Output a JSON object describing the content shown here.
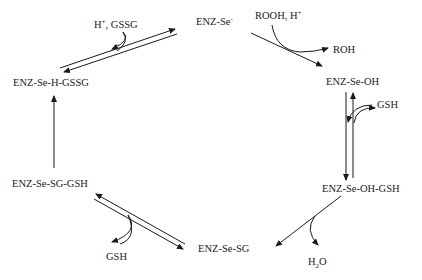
{
  "diagram": {
    "type": "reaction-cycle",
    "nodes": [
      {
        "id": "enz_se_minus",
        "label_main": "ENZ-Se",
        "label_sup": "-"
      },
      {
        "id": "enz_se_oh",
        "label": "ENZ-Se-OH"
      },
      {
        "id": "enz_se_oh_gsh",
        "label": "ENZ-Se-OH-GSH"
      },
      {
        "id": "enz_se_sg",
        "label": "ENZ-Se-SG"
      },
      {
        "id": "enz_se_sg_gsh",
        "label": "ENZ-Se-SG-GSH"
      },
      {
        "id": "enz_se_h_gssg",
        "label": "ENZ-Se-H-GSSG"
      }
    ],
    "reagents": {
      "rooh_main": "ROOH, H",
      "rooh_sup": "+",
      "roh": "ROH",
      "gsh_right": "GSH",
      "h2o_main": "H",
      "h2o_sub": "2",
      "h2o_tail": "O",
      "gsh_bottom": "GSH",
      "h_gssg_main": "H",
      "h_gssg_sup": "+",
      "h_gssg_tail": ", GSSG"
    },
    "edges": [
      {
        "from": "ENZ-Se-",
        "to": "ENZ-Se-OH",
        "reversible": false,
        "in": "ROOH, H+",
        "out": "ROH"
      },
      {
        "from": "ENZ-Se-OH",
        "to": "ENZ-Se-OH-GSH",
        "reversible": true,
        "in": "GSH"
      },
      {
        "from": "ENZ-Se-OH-GSH",
        "to": "ENZ-Se-SG",
        "reversible": false,
        "out": "H2O"
      },
      {
        "from": "ENZ-Se-SG",
        "to": "ENZ-Se-SG-GSH",
        "reversible": true,
        "in": "GSH"
      },
      {
        "from": "ENZ-Se-SG-GSH",
        "to": "ENZ-Se-H-GSSG",
        "reversible": false
      },
      {
        "from": "ENZ-Se-H-GSSG",
        "to": "ENZ-Se-",
        "reversible": true,
        "out": "H+, GSSG"
      }
    ]
  }
}
